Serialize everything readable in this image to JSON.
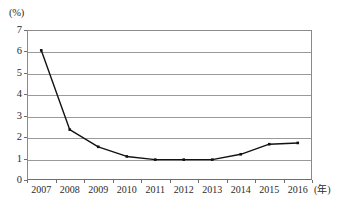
{
  "chart_data": {
    "type": "line",
    "title": "",
    "subtitle": "",
    "xlabel": "(年)",
    "ylabel": "(%)",
    "categories": [
      "2007",
      "2008",
      "2009",
      "2010",
      "2011",
      "2012",
      "2013",
      "2014",
      "2015",
      "2016"
    ],
    "values": [
      6.05,
      2.35,
      1.55,
      1.1,
      0.95,
      0.95,
      0.95,
      1.2,
      1.67,
      1.73
    ],
    "series": [
      {
        "name": "",
        "values": [
          6.05,
          2.35,
          1.55,
          1.1,
          0.95,
          0.95,
          0.95,
          1.2,
          1.67,
          1.73
        ]
      }
    ],
    "ylim": [
      0,
      7
    ],
    "ytick_labels": [
      "0",
      "1",
      "2",
      "3",
      "4",
      "5",
      "6",
      "7"
    ],
    "ytick_values": [
      0,
      1,
      2,
      3,
      4,
      5,
      6,
      7
    ],
    "xtick_labels": [
      "2007",
      "2008",
      "2009",
      "2010",
      "2011",
      "2012",
      "2013",
      "2014",
      "2015",
      "2016"
    ],
    "grid": "horizontal",
    "legend_position": "none",
    "legend_entries": [],
    "annotations": [],
    "marker": "square",
    "line_color": "#121212",
    "marker_color": "#121212",
    "grid_color": "#9a9a9a",
    "axis_color": "#6e6e6e",
    "background_color": "#ffffff"
  },
  "axes": {
    "y_unit_label": "(%)",
    "x_unit_label": "(年)"
  },
  "caption": {
    "text": ""
  }
}
